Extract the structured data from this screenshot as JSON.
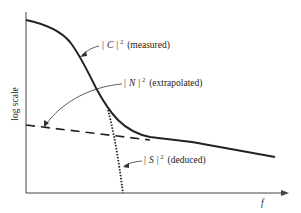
{
  "diagram": {
    "y_axis_label": "log scale",
    "x_axis_label": "f",
    "curves": [
      {
        "id": "C",
        "symbol": "C",
        "label": "| C | ² (measured)",
        "note": "(measured)",
        "style": "solid-thick"
      },
      {
        "id": "N",
        "symbol": "N",
        "label": "| N | ² (extrapolated)",
        "note": "(extrapolated)",
        "style": "dashed"
      },
      {
        "id": "S",
        "symbol": "S",
        "label": "| S | ² (deduced)",
        "note": "(deduced)",
        "style": "dotted"
      }
    ],
    "bar": "|",
    "exponent": "2"
  },
  "colors": {
    "ink": "#222222",
    "axis": "#444444",
    "background": "#ffffff"
  }
}
